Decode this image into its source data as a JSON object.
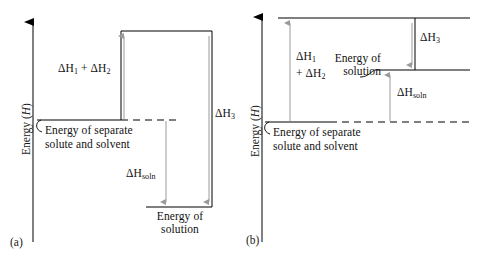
{
  "figure": {
    "background_color": "#ffffff",
    "line_color": "#000000",
    "arrow_color": "#9a9a9a"
  },
  "panels": [
    {
      "tag": "(a)",
      "process": "exothermic",
      "axis": {
        "label_text": "Energy (",
        "label_symbol": "H",
        "label_close": ")",
        "direction": "up"
      },
      "levels": [
        {
          "name": "separated-components-level",
          "label_line1": "Energy of separate",
          "label_line2": "solute and solvent"
        },
        {
          "name": "expanded-level",
          "label": ""
        },
        {
          "name": "solution-level",
          "label_line1": "Energy of",
          "label_line2": "solution"
        }
      ],
      "arrows": [
        {
          "name": "delta-h1-h2-arrow",
          "label": "ΔH",
          "sub1": "1",
          "joiner": " + ΔH",
          "sub2": "2",
          "direction": "up"
        },
        {
          "name": "delta-h3-arrow",
          "label": "ΔH",
          "sub": "3",
          "direction": "down"
        },
        {
          "name": "delta-hsoln-arrow",
          "label": "ΔH",
          "sub": "soln",
          "direction": "down"
        }
      ]
    },
    {
      "tag": "(b)",
      "process": "endothermic",
      "axis": {
        "label_text": "Energy (",
        "label_symbol": "H",
        "label_close": ")",
        "direction": "up"
      },
      "levels": [
        {
          "name": "separated-components-level",
          "label_line1": "Energy of separate",
          "label_line2": "solute and solvent"
        },
        {
          "name": "expanded-level",
          "label": ""
        },
        {
          "name": "solution-level",
          "label_line1": "Energy of",
          "label_line2": "solution"
        }
      ],
      "arrows": [
        {
          "name": "delta-h1-h2-arrow",
          "label_line1": "ΔH",
          "sub1": "1",
          "label_line2": "+ ΔH",
          "sub2": "2",
          "direction": "up"
        },
        {
          "name": "delta-h3-arrow",
          "label": "ΔH",
          "sub": "3",
          "direction": "down"
        },
        {
          "name": "delta-hsoln-arrow",
          "label": "ΔH",
          "sub": "soln",
          "direction": "up"
        }
      ]
    }
  ]
}
